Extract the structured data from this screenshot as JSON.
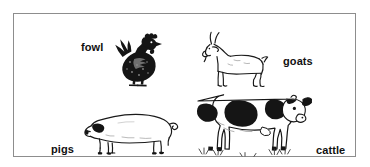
{
  "figure": {
    "background_color": "#ffffff",
    "border_color": "#8d8d8d",
    "ink_color": "#111111"
  },
  "labels": {
    "fowl": "fowl",
    "goats": "goats",
    "pigs": "pigs",
    "cattle": "cattle"
  },
  "animals": [
    {
      "id": "fowl",
      "icon": "chicken-icon",
      "label": "fowl",
      "style": "dark-stippled-silhouette",
      "facing": "right",
      "description": "Hen with comb and wattle standing on two legs"
    },
    {
      "id": "goats",
      "icon": "goat-icon",
      "label": "goats",
      "style": "white-line-outline",
      "facing": "left",
      "description": "Goat in profile with horns and short tail"
    },
    {
      "id": "pigs",
      "icon": "pig-icon",
      "label": "pigs",
      "style": "white-line-outline",
      "facing": "left",
      "description": "Pig in profile with dark ear and curly tail"
    },
    {
      "id": "cattle",
      "icon": "cow-icon",
      "label": "cattle",
      "style": "holstein-black-and-white-patches",
      "facing": "right",
      "description": "Holstein dairy cow in profile with black patches on white coat"
    }
  ]
}
